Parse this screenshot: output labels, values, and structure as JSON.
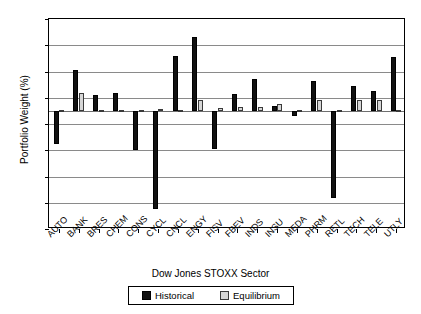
{
  "chart_data": {
    "type": "bar",
    "title": "",
    "xlabel": "Dow Jones STOXX Sector",
    "ylabel": "Portfolio Weight (%)",
    "ylim": [
      -90,
      70
    ],
    "yticks": [
      70,
      50,
      30,
      10,
      -10,
      -30,
      -50,
      -70,
      -90
    ],
    "ytick_labels": [
      "70",
      "50",
      "30",
      "10",
      "-10",
      "-30",
      "-50",
      "-70",
      "-90"
    ],
    "grid": true,
    "legend_position": "bottom",
    "categories": [
      "AUTO",
      "BANK",
      "BRES",
      "CHEM",
      "CONS",
      "CYCL",
      "CNCL",
      "ENGY",
      "FISV",
      "FBEV",
      "INDS",
      "INSU",
      "MEDA",
      "PHRM",
      "RETL",
      "TECH",
      "TELE",
      "UTLY"
    ],
    "series": [
      {
        "name": "Historical",
        "color": "#111111",
        "values": [
          -25,
          31,
          12,
          14,
          -30,
          -75,
          42,
          56,
          -29,
          13,
          24,
          4,
          -4,
          23,
          -66,
          19,
          15,
          41
        ]
      },
      {
        "name": "Equilibrium",
        "color": "#d6d6d6",
        "values": [
          1,
          14,
          1,
          1,
          0.5,
          1.5,
          1,
          8,
          2,
          3,
          3,
          5,
          1,
          8,
          0.8,
          8,
          8,
          1
        ]
      }
    ]
  },
  "legend": {
    "items": [
      {
        "label": "Historical",
        "swatch": "black-square"
      },
      {
        "label": "Equilibrium",
        "swatch": "gray-square"
      }
    ]
  }
}
